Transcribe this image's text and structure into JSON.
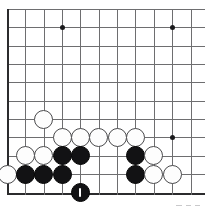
{
  "board": {
    "title": "Go board position diagram",
    "geometry": {
      "origin_x": 7,
      "origin_y": 9,
      "spacing": 18.35,
      "cols": 11,
      "rows": 11,
      "stone_diameter": 19
    },
    "edges": {
      "left_edge": true,
      "bottom_edge": true,
      "top_edge": false,
      "right_edge": false
    },
    "star_points": [
      {
        "col": 4,
        "row": 2,
        "name": "star-point-upper-left"
      },
      {
        "col": 10,
        "row": 2,
        "name": "star-point-upper-right"
      },
      {
        "col": 10,
        "row": 8,
        "name": "star-point-lower-right"
      }
    ],
    "stones": [
      {
        "col": 3,
        "row": 7,
        "color": "white",
        "marked": false,
        "label": "white-stone-c3-r7"
      },
      {
        "col": 4,
        "row": 8,
        "color": "white",
        "marked": false,
        "label": "white-stone-c4-r8"
      },
      {
        "col": 5,
        "row": 8,
        "color": "white",
        "marked": false,
        "label": "white-stone-c5-r8"
      },
      {
        "col": 6,
        "row": 8,
        "color": "white",
        "marked": false,
        "label": "white-stone-c6-r8"
      },
      {
        "col": 7,
        "row": 8,
        "color": "white",
        "marked": false,
        "label": "white-stone-c7-r8"
      },
      {
        "col": 8,
        "row": 8,
        "color": "white",
        "marked": false,
        "label": "white-stone-c8-r8"
      },
      {
        "col": 2,
        "row": 9,
        "color": "white",
        "marked": false,
        "label": "white-stone-c2-r9"
      },
      {
        "col": 3,
        "row": 9,
        "color": "white",
        "marked": false,
        "label": "white-stone-c3-r9"
      },
      {
        "col": 4,
        "row": 9,
        "color": "black",
        "marked": false,
        "label": "black-stone-c4-r9"
      },
      {
        "col": 5,
        "row": 9,
        "color": "black",
        "marked": false,
        "label": "black-stone-c5-r9"
      },
      {
        "col": 8,
        "row": 9,
        "color": "black",
        "marked": false,
        "label": "black-stone-c8-r9"
      },
      {
        "col": 9,
        "row": 9,
        "color": "white",
        "marked": false,
        "label": "white-stone-c9-r9"
      },
      {
        "col": 1,
        "row": 10,
        "color": "white",
        "marked": false,
        "label": "white-stone-c1-r10"
      },
      {
        "col": 2,
        "row": 10,
        "color": "black",
        "marked": false,
        "label": "black-stone-c2-r10"
      },
      {
        "col": 3,
        "row": 10,
        "color": "black",
        "marked": false,
        "label": "black-stone-c3-r10"
      },
      {
        "col": 4,
        "row": 10,
        "color": "black",
        "marked": false,
        "label": "black-stone-c4-r10"
      },
      {
        "col": 8,
        "row": 10,
        "color": "black",
        "marked": false,
        "label": "black-stone-c8-r10"
      },
      {
        "col": 9,
        "row": 10,
        "color": "white",
        "marked": false,
        "label": "white-stone-c9-r10"
      },
      {
        "col": 10,
        "row": 10,
        "color": "white",
        "marked": false,
        "label": "white-stone-c10-r10"
      },
      {
        "col": 5,
        "row": 11,
        "color": "black",
        "marked": true,
        "label": "black-stone-marked-c5-r11"
      }
    ],
    "colors": {
      "grid": "#6e6e70",
      "edge": "#2b2b2d",
      "black_stone": "#121214",
      "white_stone": "#fdfdfd",
      "white_stone_border": "#4a4a4c",
      "mark": "#ffffff",
      "background": "#ffffff"
    }
  }
}
